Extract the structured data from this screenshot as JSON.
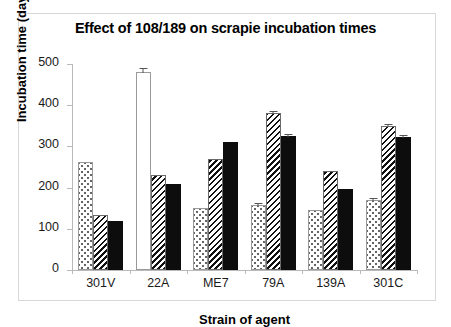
{
  "figure": {
    "title": "Effect of 108/189 on scrapie incubation times"
  },
  "chart_data": {
    "type": "bar",
    "title": "Effect of 108/189 on scrapie incubation times",
    "xlabel": "Strain of agent",
    "ylabel": "Incubation time (days)",
    "ylim": [
      0,
      500
    ],
    "yticks": [
      0,
      100,
      200,
      300,
      400,
      500
    ],
    "ytick_labels": [
      "0",
      "100",
      "200",
      "300",
      "400",
      "500"
    ],
    "grid": false,
    "legend": "none",
    "categories": [
      "301V",
      "22A",
      "ME7",
      "79A",
      "139A",
      "301C"
    ],
    "series": [
      {
        "name": "open",
        "style": "white-open",
        "values": [
          null,
          480,
          null,
          null,
          null,
          null
        ],
        "errors": [
          null,
          12,
          null,
          null,
          null,
          null
        ]
      },
      {
        "name": "dotted",
        "style": "dotted-fill",
        "values": [
          261,
          null,
          150,
          158,
          145,
          170
        ],
        "errors": [
          null,
          null,
          null,
          4,
          null,
          6
        ]
      },
      {
        "name": "hatched",
        "style": "diagonal-hatch",
        "values": [
          134,
          230,
          270,
          381,
          240,
          350
        ],
        "errors": [
          null,
          null,
          null,
          8,
          null,
          6
        ]
      },
      {
        "name": "solid",
        "style": "black-solid",
        "values": [
          120,
          209,
          311,
          326,
          197,
          322
        ],
        "errors": [
          null,
          null,
          null,
          7,
          null,
          6
        ]
      }
    ]
  }
}
